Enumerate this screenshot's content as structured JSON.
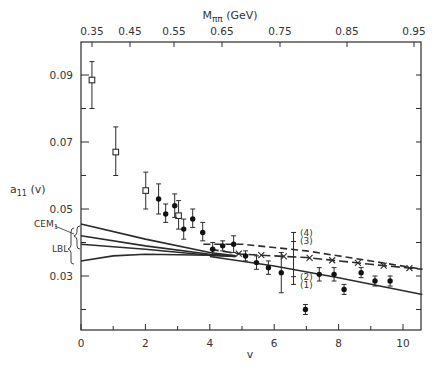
{
  "chart_data": {
    "type": "scatter",
    "title": "",
    "xlabel": "v",
    "ylabel": "a_11 (v)",
    "top_xlabel": "M_ππ (GeV)",
    "xlim": [
      0,
      10.6
    ],
    "ylim": [
      0.014,
      0.1
    ],
    "x_ticks": [
      0,
      2,
      4,
      6,
      8,
      10
    ],
    "y_ticks": [
      "0.09",
      "0.07",
      "0.05",
      "0.03"
    ],
    "top_ticks": [
      "0.35",
      "0.45",
      "0.55",
      "0.65",
      "0.75",
      "0.85",
      "0.95"
    ],
    "grid": false,
    "series": [
      {
        "name": "open squares",
        "marker": "open-square",
        "points": [
          {
            "x": 0.34,
            "y": 0.0885,
            "err": [
              0.08,
              0.094
            ]
          },
          {
            "x": 1.08,
            "y": 0.067,
            "err": [
              0.06,
              0.0745
            ]
          },
          {
            "x": 2.01,
            "y": 0.0555,
            "err": [
              0.05,
              0.061
            ]
          },
          {
            "x": 3.03,
            "y": 0.048,
            "err": [
              0.044,
              0.0525
            ]
          }
        ]
      },
      {
        "name": "filled circles",
        "marker": "filled-circle",
        "points": [
          {
            "x": 2.41,
            "y": 0.053,
            "err": [
              0.0485,
              0.0575
            ]
          },
          {
            "x": 2.63,
            "y": 0.0485,
            "err": [
              0.046,
              0.0515
            ]
          },
          {
            "x": 2.91,
            "y": 0.051,
            "err": [
              0.0475,
              0.0545
            ]
          },
          {
            "x": 3.19,
            "y": 0.044,
            "err": [
              0.041,
              0.047
            ]
          },
          {
            "x": 3.47,
            "y": 0.047,
            "err": [
              0.0445,
              0.05
            ]
          },
          {
            "x": 3.78,
            "y": 0.043,
            "err": [
              0.0405,
              0.046
            ]
          },
          {
            "x": 4.09,
            "y": 0.038,
            "err": [
              0.036,
              0.04
            ]
          },
          {
            "x": 4.4,
            "y": 0.039,
            "err": [
              0.0375,
              0.0405
            ]
          },
          {
            "x": 4.74,
            "y": 0.0395,
            "err": [
              0.037,
              0.042
            ]
          },
          {
            "x": 5.11,
            "y": 0.036,
            "err": [
              0.0345,
              0.0375
            ]
          },
          {
            "x": 5.45,
            "y": 0.034,
            "err": [
              0.032,
              0.036
            ]
          },
          {
            "x": 5.82,
            "y": 0.0325,
            "err": [
              0.0305,
              0.0345
            ]
          },
          {
            "x": 6.22,
            "y": 0.031,
            "err": [
              0.025,
              0.037
            ]
          },
          {
            "x": 6.97,
            "y": 0.02,
            "err": [
              0.0185,
              0.0215
            ]
          },
          {
            "x": 7.4,
            "y": 0.0305,
            "err": [
              0.0285,
              0.0325
            ]
          },
          {
            "x": 7.86,
            "y": 0.0305,
            "err": [
              0.0285,
              0.0325
            ]
          },
          {
            "x": 8.17,
            "y": 0.026,
            "err": [
              0.0245,
              0.0275
            ]
          },
          {
            "x": 8.7,
            "y": 0.031,
            "err": [
              0.0295,
              0.0325
            ]
          },
          {
            "x": 9.13,
            "y": 0.0285,
            "err": [
              0.027,
              0.03
            ]
          },
          {
            "x": 9.6,
            "y": 0.0285,
            "err": [
              0.027,
              0.03
            ]
          }
        ]
      }
    ],
    "curves": [
      {
        "name": "(1)",
        "style": "solid",
        "points": [
          [
            4.0,
            0.0358
          ],
          [
            6.0,
            0.033
          ],
          [
            8.0,
            0.0295
          ],
          [
            10.6,
            0.0245
          ]
        ]
      },
      {
        "name": "(2)",
        "style": "dash-cross",
        "points": [
          [
            4.0,
            0.038
          ],
          [
            5.0,
            0.0365
          ],
          [
            6.0,
            0.036
          ],
          [
            7.0,
            0.0355
          ],
          [
            8.0,
            0.0345
          ],
          [
            9.0,
            0.0335
          ],
          [
            10.6,
            0.032
          ]
        ]
      },
      {
        "name": "(3)",
        "style": "dashed",
        "points": [
          [
            3.8,
            0.0395
          ],
          [
            5.0,
            0.0395
          ],
          [
            7.0,
            0.0375
          ],
          [
            9.0,
            0.0345
          ],
          [
            10.6,
            0.032
          ]
        ]
      },
      {
        "name": "CEM1 / LBL upper",
        "style": "solid",
        "points": [
          [
            0,
            0.0455
          ],
          [
            2,
            0.041
          ],
          [
            4,
            0.037
          ],
          [
            4.8,
            0.036
          ]
        ]
      },
      {
        "name": "CEM1 / LBL mid-upper",
        "style": "solid",
        "points": [
          [
            0,
            0.042
          ],
          [
            2,
            0.039
          ],
          [
            4,
            0.0365
          ],
          [
            4.8,
            0.036
          ]
        ]
      },
      {
        "name": "CEM1 / LBL mid-lower",
        "style": "solid",
        "points": [
          [
            0,
            0.0395
          ],
          [
            2,
            0.038
          ],
          [
            4,
            0.0362
          ],
          [
            4.8,
            0.0358
          ]
        ]
      },
      {
        "name": "CEM1 / LBL lower",
        "style": "solid",
        "points": [
          [
            0,
            0.0345
          ],
          [
            1,
            0.036
          ],
          [
            2,
            0.0365
          ],
          [
            4,
            0.0362
          ],
          [
            4.8,
            0.0358
          ]
        ]
      }
    ],
    "annotations": [
      {
        "text": "CEM1",
        "x": -1.2,
        "y": 0.043
      },
      {
        "text": "LBL",
        "x": -1.0,
        "y": 0.038
      },
      {
        "text": "(4)",
        "x": 6.8,
        "y": 0.0428
      },
      {
        "text": "(3)",
        "x": 6.8,
        "y": 0.0403
      },
      {
        "text": "(2)",
        "x": 6.8,
        "y": 0.0298
      },
      {
        "text": "(1)",
        "x": 6.8,
        "y": 0.0274
      }
    ],
    "errbar_key": {
      "x": 6.6,
      "ymin": 0.0275,
      "ymax": 0.043
    }
  }
}
